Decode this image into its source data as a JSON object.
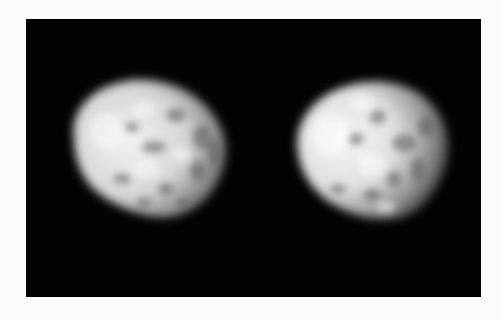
{
  "image": {
    "description": "Two blurry grayscale irregular rounded objects on a black background panel",
    "background_color": "#ffffff",
    "panel_color": "#030303",
    "objects": [
      {
        "name": "left-object",
        "center": [
          146,
          154
        ],
        "approx_size": [
          160,
          140
        ],
        "brightness": "#e6e6e6"
      },
      {
        "name": "right-object",
        "center": [
          370,
          152
        ],
        "approx_size": [
          160,
          140
        ],
        "brightness": "#ececec"
      }
    ]
  }
}
